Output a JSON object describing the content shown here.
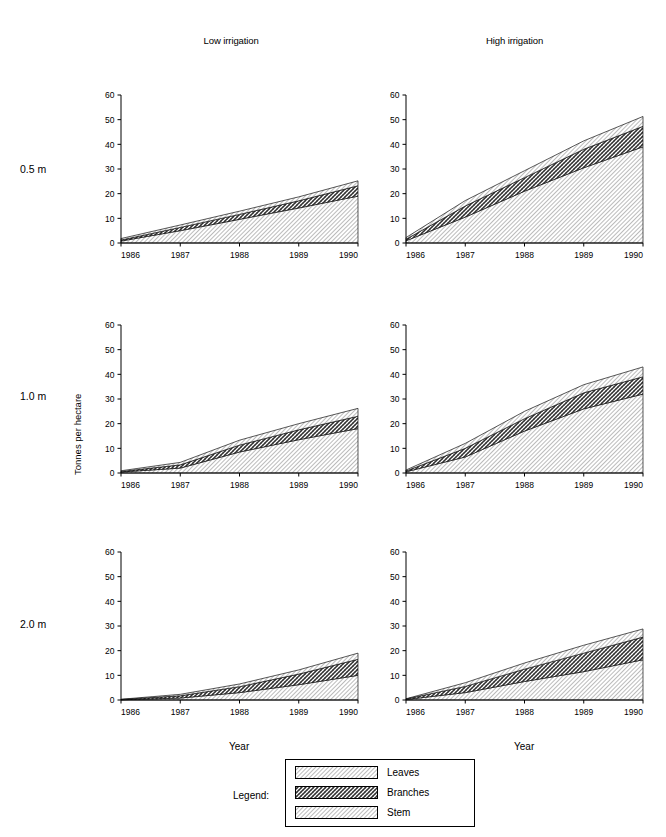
{
  "figure": {
    "column_titles": [
      "Low irrigation",
      "High irrigation"
    ],
    "row_labels": [
      "0.5 m",
      "1.0 m",
      "2.0 m"
    ],
    "ylabel": "Tonnes per hectare",
    "xlabel": "Year",
    "legend_word": "Legend:"
  },
  "legend": {
    "entries": [
      {
        "label": "Leaves",
        "pattern": "diagonal-hatch-light"
      },
      {
        "label": "Branches",
        "pattern": "cross-hatch-dark"
      },
      {
        "label": "Stem",
        "pattern": "diagonal-hatch-light"
      }
    ]
  },
  "chart_data": {
    "type": "area",
    "xlabel": "Year",
    "ylabel": "Tonnes per hectare",
    "x": [
      1986,
      1987,
      1988,
      1989,
      1990
    ],
    "xtick_labels": [
      "1986",
      "1987",
      "1988",
      "1989",
      "1990"
    ],
    "ytick_labels": [
      "0",
      "10",
      "20",
      "30",
      "40",
      "50",
      "60"
    ],
    "ylim": [
      0,
      60
    ],
    "xlim": [
      1986,
      1990
    ],
    "grid": false,
    "stacked": true,
    "legend_position": "bottom-center",
    "series_order": [
      "Stem",
      "Branches",
      "Leaves"
    ],
    "panels": [
      {
        "row_label": "0.5 m",
        "column_title": "Low irrigation",
        "series": [
          {
            "name": "Stem",
            "values": [
              0.8,
              5.0,
              9.6,
              14.2,
              19.0
            ]
          },
          {
            "name": "Branches",
            "values": [
              0.4,
              1.3,
              2.0,
              2.9,
              4.2
            ]
          },
          {
            "name": "Leaves",
            "values": [
              0.6,
              1.0,
              1.3,
              1.6,
              2.0
            ]
          }
        ],
        "totals": [
          1.8,
          7.3,
          12.9,
          18.7,
          25.2
        ]
      },
      {
        "row_label": "0.5 m",
        "column_title": "High irrigation",
        "series": [
          {
            "name": "Stem",
            "values": [
              0.9,
              10.5,
              21.0,
              30.5,
              39.0
            ]
          },
          {
            "name": "Branches",
            "values": [
              0.6,
              4.5,
              5.5,
              7.5,
              8.3
            ]
          },
          {
            "name": "Leaves",
            "values": [
              0.7,
              2.2,
              2.8,
              3.4,
              4.0
            ]
          }
        ],
        "totals": [
          2.2,
          17.2,
          29.3,
          41.4,
          51.3
        ]
      },
      {
        "row_label": "1.0 m",
        "column_title": "Low irrigation",
        "series": [
          {
            "name": "Stem",
            "values": [
              0.4,
              2.0,
              8.5,
              13.5,
              18.0
            ]
          },
          {
            "name": "Branches",
            "values": [
              0.2,
              1.3,
              2.8,
              4.0,
              5.0
            ]
          },
          {
            "name": "Leaves",
            "values": [
              0.3,
              1.0,
              2.0,
              2.5,
              3.2
            ]
          }
        ],
        "totals": [
          0.9,
          4.3,
          13.3,
          20.0,
          26.2
        ]
      },
      {
        "row_label": "1.0 m",
        "column_title": "High irrigation",
        "series": [
          {
            "name": "Stem",
            "values": [
              0.5,
              6.5,
              17.0,
              26.0,
              32.0
            ]
          },
          {
            "name": "Branches",
            "values": [
              0.3,
              3.5,
              5.0,
              6.5,
              7.0
            ]
          },
          {
            "name": "Leaves",
            "values": [
              0.4,
              2.0,
              3.0,
              3.3,
              4.0
            ]
          }
        ],
        "totals": [
          1.2,
          12.0,
          25.0,
          35.8,
          43.0
        ]
      },
      {
        "row_label": "2.0 m",
        "column_title": "Low irrigation",
        "series": [
          {
            "name": "Stem",
            "values": [
              0.1,
              0.8,
              3.0,
              6.2,
              10.0
            ]
          },
          {
            "name": "Branches",
            "values": [
              0.1,
              0.9,
              2.4,
              4.3,
              6.5
            ]
          },
          {
            "name": "Leaves",
            "values": [
              0.1,
              0.6,
              1.1,
              1.7,
              2.5
            ]
          }
        ],
        "totals": [
          0.3,
          2.3,
          6.5,
          12.2,
          19.0
        ]
      },
      {
        "row_label": "2.0 m",
        "column_title": "High irrigation",
        "series": [
          {
            "name": "Stem",
            "values": [
              0.2,
              3.0,
              7.5,
              11.5,
              16.3
            ]
          },
          {
            "name": "Branches",
            "values": [
              0.2,
              2.5,
              5.0,
              7.5,
              9.2
            ]
          },
          {
            "name": "Leaves",
            "values": [
              0.1,
              1.5,
              2.5,
              3.2,
              3.3
            ]
          }
        ],
        "totals": [
          0.5,
          7.0,
          15.0,
          22.2,
          28.8
        ]
      }
    ]
  }
}
